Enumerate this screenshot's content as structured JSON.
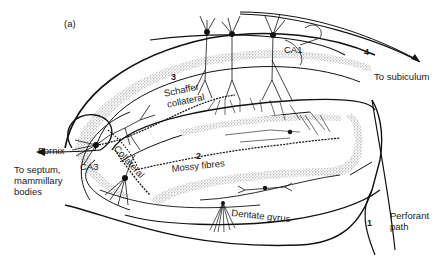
{
  "figure": {
    "panel_label": "(a)",
    "regions": {
      "ca1": "CA1",
      "ca3": "CA3",
      "dentate_gyrus": "Dentate gyrus"
    },
    "pathways": {
      "perforant_path": "Perforant path",
      "perforant_path_line1": "Perforant",
      "perforant_path_line2": "path",
      "mossy_fibres": "Mossy fibres",
      "schaffer_collateral_line1": "Schaffer",
      "schaffer_collateral_line2": "collateral",
      "collateral": "Collateral",
      "fornix": "Fornix"
    },
    "outputs": {
      "to_subiculum": "To subiculum",
      "to_septum_line1": "To  septum,",
      "to_septum_line2": "mammillary",
      "to_septum_line3": "bodies"
    },
    "step_numbers": {
      "one": "1",
      "two": "2",
      "three": "3",
      "four": "4"
    }
  }
}
